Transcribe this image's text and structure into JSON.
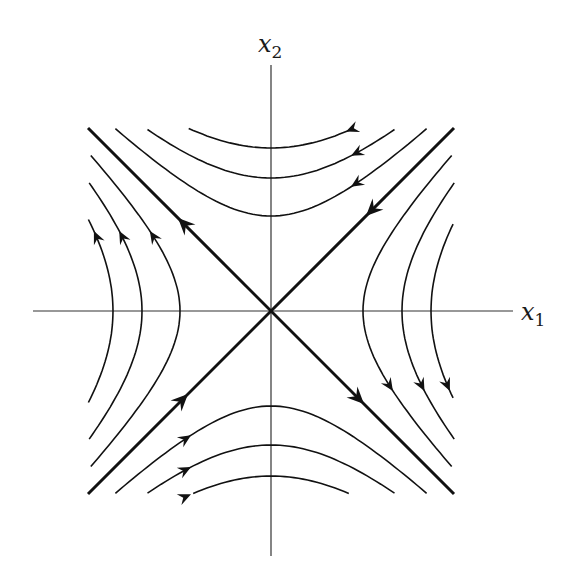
{
  "figure": {
    "axes": {
      "x_label": "x",
      "x_sub": "1",
      "y_label": "x",
      "y_sub": "2",
      "origin_px": [
        271,
        311
      ],
      "x_axis_px": [
        33,
        513
      ],
      "y_axis_px": [
        65,
        556
      ]
    },
    "colors": {
      "background": "#ffffff",
      "stroke": "#111111",
      "axis": "#333333"
    },
    "box_half_extent_px": 183,
    "separatrices": [
      {
        "name": "stable-manifold",
        "direction": "x2 = x1",
        "flow": "toward-origin"
      },
      {
        "name": "unstable-manifold",
        "direction": "x2 = -x1",
        "flow": "away-from-origin"
      }
    ],
    "families": {
      "top": {
        "vertices_px": [
          95,
          133,
          163
        ],
        "flow": "leftward"
      },
      "bottom": {
        "vertices_px": [
          95,
          134,
          165
        ],
        "flow": "rightward"
      },
      "left": {
        "vertices_px": [
          91,
          129,
          158
        ],
        "flow": "upward"
      },
      "right": {
        "vertices_px": [
          92,
          131,
          160
        ],
        "flow": "downward"
      }
    }
  },
  "chart_data": {
    "type": "scatter",
    "xlabel": "x1",
    "ylabel": "x2",
    "system": "dx1/dt = -x2, dx2/dt = -x1",
    "equilibrium": [
      0,
      0
    ],
    "separatrices": [
      {
        "line": "x2 = x1",
        "arrows": "toward origin"
      },
      {
        "line": "x2 = -x1",
        "arrows": "away from origin"
      }
    ],
    "trajectories": [
      {
        "family": "top",
        "equation": "x2^2 - x1^2 = c",
        "c_px_vertex": [
          95,
          133,
          163
        ],
        "arrow_direction": "left"
      },
      {
        "family": "bottom",
        "equation": "x2^2 - x1^2 = c",
        "c_px_vertex": [
          -95,
          -134,
          -165
        ],
        "arrow_direction": "right"
      },
      {
        "family": "left",
        "equation": "x1^2 - x2^2 = c",
        "c_px_vertex": [
          -91,
          -129,
          -158
        ],
        "arrow_direction": "up"
      },
      {
        "family": "right",
        "equation": "x1^2 - x2^2 = c",
        "c_px_vertex": [
          92,
          131,
          160
        ],
        "arrow_direction": "down"
      }
    ],
    "grid": false,
    "legend": null
  }
}
